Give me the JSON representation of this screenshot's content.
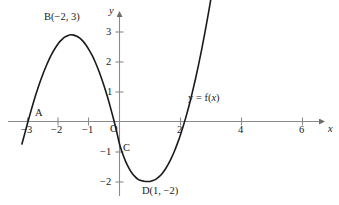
{
  "figure": {
    "background_color": "#ffffff",
    "axis_color": "#8a8a8a",
    "curve_color": "#1a1a1a",
    "text_color": "#1a1a1a"
  },
  "chart_data": {
    "type": "line",
    "title": "",
    "xlabel": "x",
    "ylabel": "y",
    "xlim": [
      -3.3,
      6.8
    ],
    "ylim": [
      -2.5,
      3.5
    ],
    "grid": false,
    "legend": "none",
    "x_ticks": [
      -3,
      -2,
      -1,
      2,
      4,
      6
    ],
    "x_tick_labels": [
      "−3",
      "−2",
      "−1",
      "2",
      "4",
      "6"
    ],
    "y_ticks": [
      3,
      2,
      1,
      -1,
      -2
    ],
    "y_tick_labels": [
      "3",
      "2",
      "1",
      "−1",
      "−2"
    ],
    "origin_label": "O",
    "series": [
      {
        "name": "y = f(x)",
        "label_text": "y = f(x)",
        "x": [
          -3.2,
          -3.1,
          -3.0,
          -2.9,
          -2.8,
          -2.7,
          -2.6,
          -2.5,
          -2.4,
          -2.3,
          -2.2,
          -2.1,
          -2.0,
          -1.9,
          -1.8,
          -1.7,
          -1.6,
          -1.5,
          -1.4,
          -1.3,
          -1.2,
          -1.1,
          -1.0,
          -0.9,
          -0.8,
          -0.7,
          -0.6,
          -0.5,
          -0.4,
          -0.3,
          -0.2,
          -0.1,
          0.0,
          0.1,
          0.2,
          0.3,
          0.4,
          0.5,
          0.6,
          0.7,
          0.8,
          0.9,
          1.0,
          1.1,
          1.2,
          1.3,
          1.4,
          1.5,
          1.6,
          1.7,
          1.8,
          1.9,
          2.0,
          2.1,
          2.2,
          2.3,
          2.4,
          2.5,
          2.6,
          2.7,
          2.8,
          2.9,
          3.0,
          3.05
        ],
        "y": [
          -0.75,
          -0.38,
          0.0,
          0.36,
          0.71,
          1.03,
          1.33,
          1.61,
          1.86,
          2.09,
          2.29,
          2.46,
          2.61,
          2.72,
          2.81,
          2.86,
          2.89,
          2.88,
          2.84,
          2.78,
          2.68,
          2.55,
          2.39,
          2.21,
          1.99,
          1.74,
          1.47,
          1.17,
          0.84,
          0.48,
          0.1,
          -0.31,
          -0.75,
          -1.07,
          -1.33,
          -1.54,
          -1.71,
          -1.83,
          -1.92,
          -1.97,
          -1.99,
          -2.0,
          -2.0,
          -1.97,
          -1.92,
          -1.84,
          -1.73,
          -1.59,
          -1.42,
          -1.22,
          -0.99,
          -0.73,
          -0.44,
          -0.12,
          0.23,
          0.61,
          1.02,
          1.46,
          1.93,
          2.43,
          2.96,
          3.52,
          4.11,
          4.42
        ]
      }
    ],
    "annotated_points": [
      {
        "id": "A",
        "label": "A",
        "x": -3,
        "y": 0,
        "description": "x-intercept near x = -3"
      },
      {
        "id": "B",
        "label": "B(−2, 3)",
        "x": -2,
        "y": 3,
        "description": "local maximum"
      },
      {
        "id": "C",
        "label": "C",
        "x": 0,
        "y": -1,
        "description": "y-intercept"
      },
      {
        "id": "D",
        "label": "D(1, −2)",
        "x": 1,
        "y": -2,
        "description": "local minimum"
      }
    ]
  },
  "labels": {
    "point_a": "A",
    "point_b": "B(−2, 3)",
    "point_c": "C",
    "point_d": "D(1, −2)",
    "origin": "O",
    "axis_x": "x",
    "axis_y": "y",
    "curve_eq_lhs": "y = f(",
    "curve_eq_var": "x",
    "curve_eq_rhs": ")",
    "tick_xm3": "−3",
    "tick_xm2": "−2",
    "tick_xm1": "−1",
    "tick_x2": "2",
    "tick_x4": "4",
    "tick_x6": "6",
    "tick_y3": "3",
    "tick_y2": "2",
    "tick_y1": "1",
    "tick_ym1": "−1",
    "tick_ym2": "−2"
  }
}
